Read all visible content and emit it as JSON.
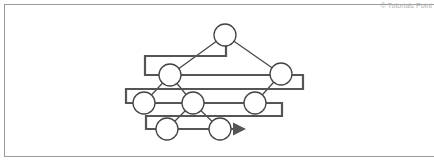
{
  "watermark": "© Tutorials Point",
  "diagram": {
    "type": "binary tree with zig-zag (boustrophedon) level-order traversal path",
    "colors": {
      "node_stroke": "#444444",
      "node_fill": "#ffffff",
      "edge": "#444444",
      "path": "#555555",
      "frame": "#9a9a9a"
    },
    "node_radius": 11,
    "nodes": [
      {
        "id": "n1",
        "level": 1,
        "x": 225,
        "y": 35
      },
      {
        "id": "n2",
        "level": 2,
        "x": 170,
        "y": 75
      },
      {
        "id": "n3",
        "level": 2,
        "x": 281,
        "y": 74
      },
      {
        "id": "n4",
        "level": 3,
        "x": 144,
        "y": 103
      },
      {
        "id": "n5",
        "level": 3,
        "x": 193,
        "y": 103
      },
      {
        "id": "n6",
        "level": 3,
        "x": 255,
        "y": 103
      },
      {
        "id": "n7",
        "level": 4,
        "x": 167,
        "y": 129
      },
      {
        "id": "n8",
        "level": 4,
        "x": 220,
        "y": 129
      }
    ],
    "edges": [
      [
        "n1",
        "n2"
      ],
      [
        "n1",
        "n3"
      ],
      [
        "n2",
        "n4"
      ],
      [
        "n2",
        "n5"
      ],
      [
        "n3",
        "n6"
      ],
      [
        "n5",
        "n7"
      ],
      [
        "n5",
        "n8"
      ]
    ],
    "traversal_path": [
      [
        225,
        35
      ],
      [
        226,
        46
      ],
      [
        226,
        56
      ],
      [
        145,
        56
      ],
      [
        145,
        75
      ],
      [
        170,
        75
      ],
      [
        281,
        75
      ],
      [
        303,
        75
      ],
      [
        303,
        89
      ],
      [
        126,
        89
      ],
      [
        126,
        103
      ],
      [
        144,
        103
      ],
      [
        255,
        103
      ],
      [
        282,
        103
      ],
      [
        282,
        116
      ],
      [
        146,
        116
      ],
      [
        146,
        129
      ],
      [
        167,
        129
      ],
      [
        220,
        129
      ],
      [
        244,
        129
      ]
    ],
    "arrow_end": [
      246,
      129
    ]
  }
}
